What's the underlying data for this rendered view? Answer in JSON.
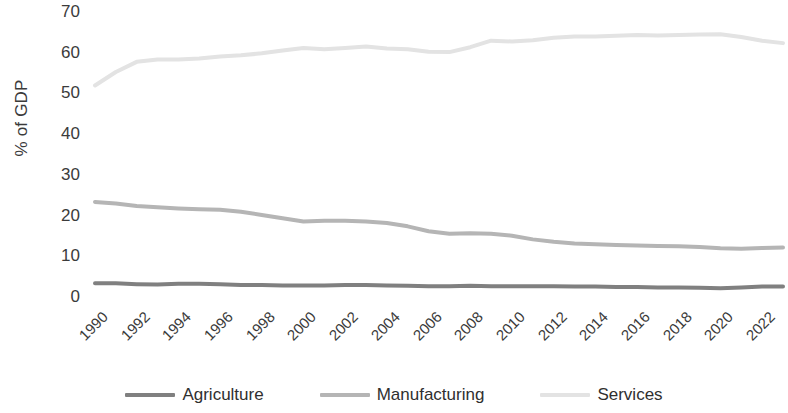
{
  "chart_data": {
    "type": "line",
    "title": "",
    "xlabel": "",
    "ylabel": "% of GDP",
    "ylim": [
      0,
      70
    ],
    "ytick_labels": [
      "70",
      "60",
      "50",
      "40",
      "30",
      "20",
      "10",
      "0"
    ],
    "ytick_values": [
      70,
      60,
      50,
      40,
      30,
      20,
      10,
      0
    ],
    "grid": false,
    "legend_position": "bottom",
    "x": [
      1990,
      1991,
      1992,
      1993,
      1994,
      1995,
      1996,
      1997,
      1998,
      1999,
      2000,
      2001,
      2002,
      2003,
      2004,
      2005,
      2006,
      2007,
      2008,
      2009,
      2010,
      2011,
      2012,
      2013,
      2014,
      2015,
      2016,
      2017,
      2018,
      2019,
      2020,
      2021,
      2022,
      2023
    ],
    "xtick_labels": [
      "1990",
      "1992",
      "1994",
      "1996",
      "1998",
      "2000",
      "2002",
      "2004",
      "2006",
      "2008",
      "2010",
      "2012",
      "2014",
      "2016",
      "2018",
      "2020",
      "2022"
    ],
    "series": [
      {
        "name": "Agriculture",
        "color": "#808080",
        "values": [
          3.6,
          3.6,
          3.4,
          3.3,
          3.5,
          3.5,
          3.4,
          3.2,
          3.2,
          3.1,
          3.1,
          3.1,
          3.2,
          3.2,
          3.1,
          3.0,
          2.9,
          2.9,
          3.0,
          2.9,
          2.9,
          2.9,
          2.9,
          2.8,
          2.8,
          2.7,
          2.7,
          2.6,
          2.6,
          2.5,
          2.4,
          2.6,
          2.8,
          2.8
        ]
      },
      {
        "name": "Manufacturing",
        "color": "#b5b5b5",
        "values": [
          23.6,
          23.2,
          22.6,
          22.3,
          22.0,
          21.8,
          21.7,
          21.2,
          20.4,
          19.6,
          18.8,
          19.0,
          19.0,
          18.8,
          18.4,
          17.6,
          16.4,
          15.8,
          15.9,
          15.8,
          15.3,
          14.4,
          13.8,
          13.4,
          13.2,
          13.0,
          12.9,
          12.8,
          12.7,
          12.5,
          12.2,
          12.1,
          12.3,
          12.4
        ]
      },
      {
        "name": "Services",
        "color": "#e3e3e3",
        "values": [
          52.2,
          55.5,
          58.0,
          58.6,
          58.6,
          58.8,
          59.3,
          59.6,
          60.1,
          60.8,
          61.4,
          61.1,
          61.4,
          61.8,
          61.3,
          61.1,
          60.5,
          60.4,
          61.6,
          63.2,
          63.0,
          63.3,
          63.9,
          64.2,
          64.2,
          64.4,
          64.6,
          64.5,
          64.6,
          64.7,
          64.8,
          64.1,
          63.2,
          62.6
        ]
      }
    ]
  },
  "legend": {
    "items": [
      {
        "label": "Agriculture",
        "color": "#808080"
      },
      {
        "label": "Manufacturing",
        "color": "#b5b5b5"
      },
      {
        "label": "Services",
        "color": "#e3e3e3"
      }
    ]
  }
}
